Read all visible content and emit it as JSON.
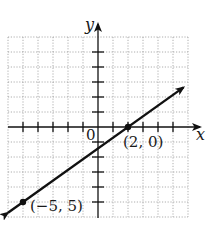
{
  "chart_data": {
    "type": "line",
    "title": "",
    "xlabel": "x",
    "ylabel": "y",
    "xlim": [
      -6,
      6
    ],
    "ylim": [
      -6,
      6
    ],
    "grid": true,
    "grid_style": "dotted",
    "origin_label": "0",
    "x_ticks": [
      -5,
      -4,
      -3,
      -2,
      -1,
      1,
      2,
      3,
      4,
      5
    ],
    "y_ticks": [
      -5,
      -4,
      -3,
      -2,
      -1,
      1,
      2,
      3,
      4,
      5
    ],
    "series": [
      {
        "name": "line",
        "x": [
          -5,
          2
        ],
        "y": [
          -5,
          0
        ],
        "arrows": "both",
        "color": "#111111"
      }
    ],
    "points": [
      {
        "x": 2,
        "y": 0,
        "label": "(2, 0)"
      },
      {
        "x": -5,
        "y": -5,
        "label": "(−5, 5)"
      }
    ]
  },
  "labels": {
    "x_axis": "x",
    "y_axis": "y",
    "origin": "0",
    "point_a": "(2, 0)",
    "point_b": "(−5, 5)"
  }
}
